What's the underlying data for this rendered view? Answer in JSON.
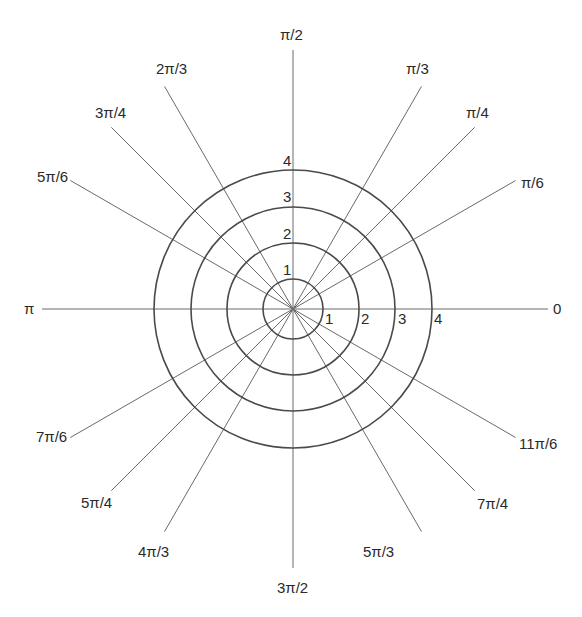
{
  "diagram": {
    "type": "polar-coordinate-grid",
    "center": [
      293,
      309
    ],
    "spoke_length": 257,
    "rings": [
      {
        "value": 1,
        "label": "1",
        "radius": 30
      },
      {
        "value": 2,
        "label": "2",
        "radius": 66
      },
      {
        "value": 3,
        "label": "3",
        "radius": 102
      },
      {
        "value": 4,
        "label": "4",
        "radius": 139
      }
    ],
    "angles": [
      {
        "label": "0",
        "deg": 0
      },
      {
        "label": "π/6",
        "deg": 30
      },
      {
        "label": "π/4",
        "deg": 45
      },
      {
        "label": "π/3",
        "deg": 60
      },
      {
        "label": "π/2",
        "deg": 90
      },
      {
        "label": "2π/3",
        "deg": 120
      },
      {
        "label": "3π/4",
        "deg": 135
      },
      {
        "label": "5π/6",
        "deg": 150
      },
      {
        "label": "π",
        "deg": 180
      },
      {
        "label": "7π/6",
        "deg": 210
      },
      {
        "label": "5π/4",
        "deg": 225
      },
      {
        "label": "4π/3",
        "deg": 240
      },
      {
        "label": "3π/2",
        "deg": 270
      },
      {
        "label": "5π/3",
        "deg": 300
      },
      {
        "label": "7π/4",
        "deg": 315
      },
      {
        "label": "11π/6",
        "deg": 330
      }
    ],
    "colors": {
      "spoke": "#6a6a6a",
      "ring": "#4a4a4a",
      "text": "#2a2a2a"
    }
  }
}
